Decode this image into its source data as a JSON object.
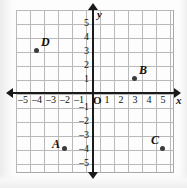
{
  "figure": {
    "kind": "coordinate-plane",
    "background_color": "#fdfdfd",
    "grid_color": "#b9b9b9",
    "axis_color": "#1a1a1a",
    "point_color": "#3a3a3a"
  },
  "axes": {
    "x_name": "x",
    "y_name": "y",
    "origin_label": "O",
    "x_ticks": [
      "–5",
      "–4",
      "–3",
      "–2",
      "–1",
      "1",
      "2",
      "3",
      "4",
      "5"
    ],
    "y_ticks": [
      "5",
      "4",
      "3",
      "2",
      "1",
      "–1",
      "–2",
      "–3",
      "–4",
      "–5"
    ],
    "x_range": [
      -5.5,
      5.5
    ],
    "y_range": [
      -5.8,
      5.8
    ],
    "unit_px": 14
  },
  "chart_data": {
    "type": "scatter",
    "title": "",
    "xlabel": "x",
    "ylabel": "y",
    "xlim": [
      -5.5,
      5.5
    ],
    "ylim": [
      -5.8,
      5.8
    ],
    "grid": true,
    "legend": "none",
    "points": [
      {
        "label": "A",
        "x": -2,
        "y": -4,
        "label_position": "left"
      },
      {
        "label": "B",
        "x": 3,
        "y": 1,
        "label_position": "upper-right"
      },
      {
        "label": "C",
        "x": 5,
        "y": -4,
        "label_position": "upper-left"
      },
      {
        "label": "D",
        "x": -4,
        "y": 3,
        "label_position": "upper-right"
      }
    ]
  }
}
